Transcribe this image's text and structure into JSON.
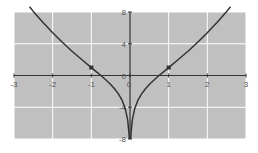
{
  "chart_data": {
    "type": "line",
    "title": "",
    "xlabel": "",
    "ylabel": "",
    "xlim": [
      -3,
      3
    ],
    "ylim": [
      -8,
      8
    ],
    "grid": true,
    "legend": null,
    "x_ticks": [
      -3,
      -2,
      -1,
      0,
      1,
      2,
      3
    ],
    "x_tick_labels": [
      "-3",
      "-2",
      "-1",
      "0",
      "1",
      "2",
      "3"
    ],
    "y_ticks": [
      -8,
      -4,
      0,
      4,
      8
    ],
    "y_tick_labels": [
      "-8",
      "-4",
      "0",
      "4",
      "8"
    ],
    "series": [
      {
        "name": "y = x^2 + 2 ln|x|",
        "x": [
          -2.6,
          -2.5,
          -2.25,
          -2.0,
          -1.75,
          -1.5,
          -1.25,
          -1.0,
          -0.85,
          -0.75,
          -0.6,
          -0.5,
          -0.4,
          -0.3,
          -0.2,
          -0.12,
          -0.06,
          -0.03,
          -0.018
        ],
        "y": [
          8.67,
          8.08,
          6.69,
          5.39,
          4.18,
          3.06,
          2.01,
          1.0,
          0.4,
          0.0,
          -0.66,
          -1.14,
          -1.67,
          -2.32,
          -3.18,
          -4.23,
          -5.62,
          -7.01,
          -8.0
        ],
        "color": "#333333"
      },
      {
        "name": "y = x^2 + 2 ln|x| (right branch)",
        "x": [
          0.018,
          0.03,
          0.06,
          0.12,
          0.2,
          0.3,
          0.4,
          0.5,
          0.6,
          0.75,
          0.85,
          1.0,
          1.25,
          1.5,
          1.75,
          2.0,
          2.25,
          2.5,
          2.6
        ],
        "y": [
          -8.0,
          -7.01,
          -5.62,
          -4.23,
          -3.18,
          -2.32,
          -1.67,
          -1.14,
          -0.66,
          0.0,
          0.4,
          1.0,
          2.01,
          3.06,
          4.18,
          5.39,
          6.69,
          8.08,
          8.67
        ],
        "color": "#333333"
      }
    ],
    "markers": [
      {
        "x": -1,
        "y": 1
      },
      {
        "x": 1,
        "y": 1
      }
    ],
    "colors": {
      "plot_background": "#c0c0c0",
      "gridline": "#ffffff",
      "axis": "#333333",
      "curve": "#333333",
      "marker": "#333333"
    }
  }
}
